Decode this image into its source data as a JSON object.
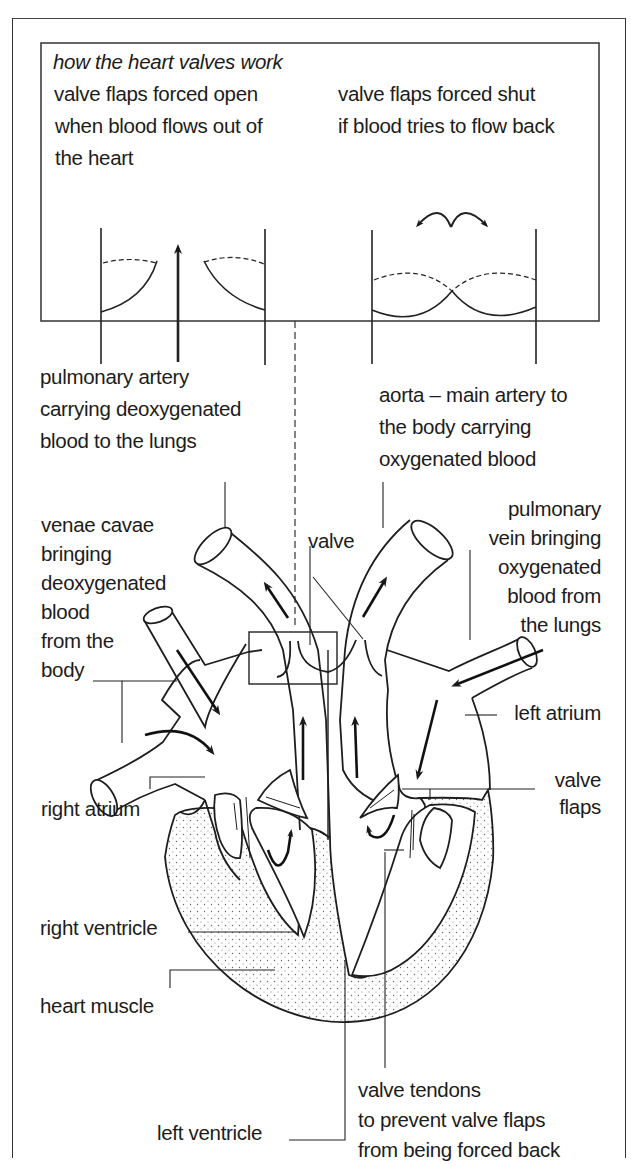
{
  "inset": {
    "title": "how the heart valves work",
    "open_caption": [
      "valve flaps forced open",
      "when blood flows out of",
      "the heart"
    ],
    "shut_caption": [
      "valve flaps forced shut",
      "if blood tries to flow back"
    ]
  },
  "labels": {
    "pulmonary_artery": [
      "pulmonary artery",
      "carrying  deoxygenated",
      "blood to the  lungs"
    ],
    "aorta": [
      "aorta – main artery to",
      "the body carrying",
      "oxygenated blood"
    ],
    "venae_cavae": [
      "venae cavae",
      "bringing",
      "deoxygenated",
      "blood",
      "from the",
      "body"
    ],
    "valve": "valve",
    "pulmonary_vein": [
      "pulmonary",
      "vein bringing",
      "oxygenated",
      "blood from",
      "the lungs"
    ],
    "left_atrium": "left atrium",
    "right_atrium": "right atrium",
    "valve_flaps": [
      "valve",
      "flaps"
    ],
    "right_ventricle": "right ventricle",
    "heart_muscle": "heart muscle",
    "left_ventricle": "left ventricle",
    "valve_tendons": [
      "valve tendons",
      "to prevent valve flaps",
      "from being forced back"
    ]
  },
  "colors": {
    "ink": "#1c1c1c",
    "background": "#ffffff",
    "stipple": "#6a6a6a"
  }
}
